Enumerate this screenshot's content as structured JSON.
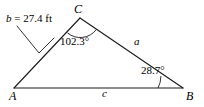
{
  "figure": {
    "type": "triangle-diagram",
    "background_color": "#ffffff",
    "stroke_color": "#1a1a1a",
    "vertices": {
      "A": {
        "label": "A",
        "x": 14,
        "y": 88
      },
      "B": {
        "label": "B",
        "x": 183,
        "y": 88
      },
      "C": {
        "label": "C",
        "x": 80,
        "y": 18
      }
    },
    "sides": {
      "a": {
        "label": "a",
        "from": "C",
        "to": "B"
      },
      "b": {
        "label": "b",
        "from": "A",
        "to": "C"
      },
      "c": {
        "label": "c",
        "from": "A",
        "to": "B"
      }
    },
    "angles": {
      "C": {
        "label": "102.3°",
        "value": 102.3,
        "unit": "degrees",
        "vertex": "C"
      },
      "B": {
        "label": "28.7°",
        "value": 28.7,
        "unit": "degrees",
        "vertex": "B"
      }
    },
    "measurements": {
      "b": {
        "variable": "b",
        "separator": " = ",
        "value": "27.4",
        "unit": "ft",
        "full_text": "b = 27.4 ft",
        "points_to_side": "b"
      }
    }
  }
}
